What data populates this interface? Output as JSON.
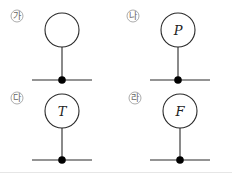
{
  "diagram": {
    "panels": [
      {
        "label": "가",
        "symbol": "",
        "cx": 62,
        "cy": 30,
        "base_y": 80
      },
      {
        "label": "나",
        "symbol": "P",
        "cx": 178,
        "cy": 30,
        "base_y": 80
      },
      {
        "label": "다",
        "symbol": "T",
        "cx": 62,
        "cy": 111,
        "base_y": 160
      },
      {
        "label": "라",
        "symbol": "F",
        "cx": 180,
        "cy": 111,
        "base_y": 160
      }
    ],
    "colors": {
      "line": "#2a2a2a",
      "label": "#666666",
      "divider": "#e6e6e6"
    }
  }
}
